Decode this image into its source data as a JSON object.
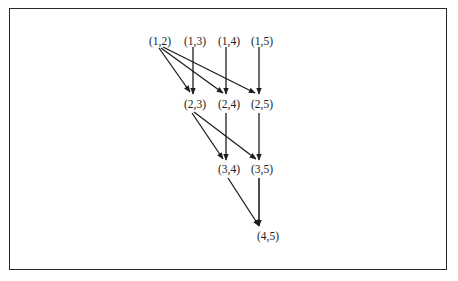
{
  "diagram": {
    "type": "directed-graph",
    "nodes": [
      {
        "id": "n12",
        "label": "(1,2)",
        "x": 160,
        "y": 41
      },
      {
        "id": "n13",
        "label": "(1,3)",
        "x": 195,
        "y": 41
      },
      {
        "id": "n14",
        "label": "(1,4)",
        "x": 229,
        "y": 41
      },
      {
        "id": "n15",
        "label": "(1,5)",
        "x": 262,
        "y": 41
      },
      {
        "id": "n23",
        "label": "(2,3)",
        "x": 195,
        "y": 104
      },
      {
        "id": "n24",
        "label": "(2,4)",
        "x": 229,
        "y": 104
      },
      {
        "id": "n25",
        "label": "(2,5)",
        "x": 262,
        "y": 104
      },
      {
        "id": "n34",
        "label": "(3,4)",
        "x": 229,
        "y": 169
      },
      {
        "id": "n35",
        "label": "(3,5)",
        "x": 262,
        "y": 169
      },
      {
        "id": "n45",
        "label": "(4,5)",
        "x": 268,
        "y": 236
      }
    ],
    "edges": [
      {
        "from": "(1,2)",
        "to": "(2,3)"
      },
      {
        "from": "(1,2)",
        "to": "(2,4)"
      },
      {
        "from": "(1,2)",
        "to": "(2,5)"
      },
      {
        "from": "(1,3)",
        "to": "(2,3)"
      },
      {
        "from": "(1,4)",
        "to": "(2,4)"
      },
      {
        "from": "(1,5)",
        "to": "(2,5)"
      },
      {
        "from": "(2,3)",
        "to": "(3,4)"
      },
      {
        "from": "(2,3)",
        "to": "(3,5)"
      },
      {
        "from": "(2,4)",
        "to": "(3,4)"
      },
      {
        "from": "(2,5)",
        "to": "(3,5)"
      },
      {
        "from": "(3,4)",
        "to": "(4,5)"
      },
      {
        "from": "(3,5)",
        "to": "(4,5)"
      }
    ]
  }
}
